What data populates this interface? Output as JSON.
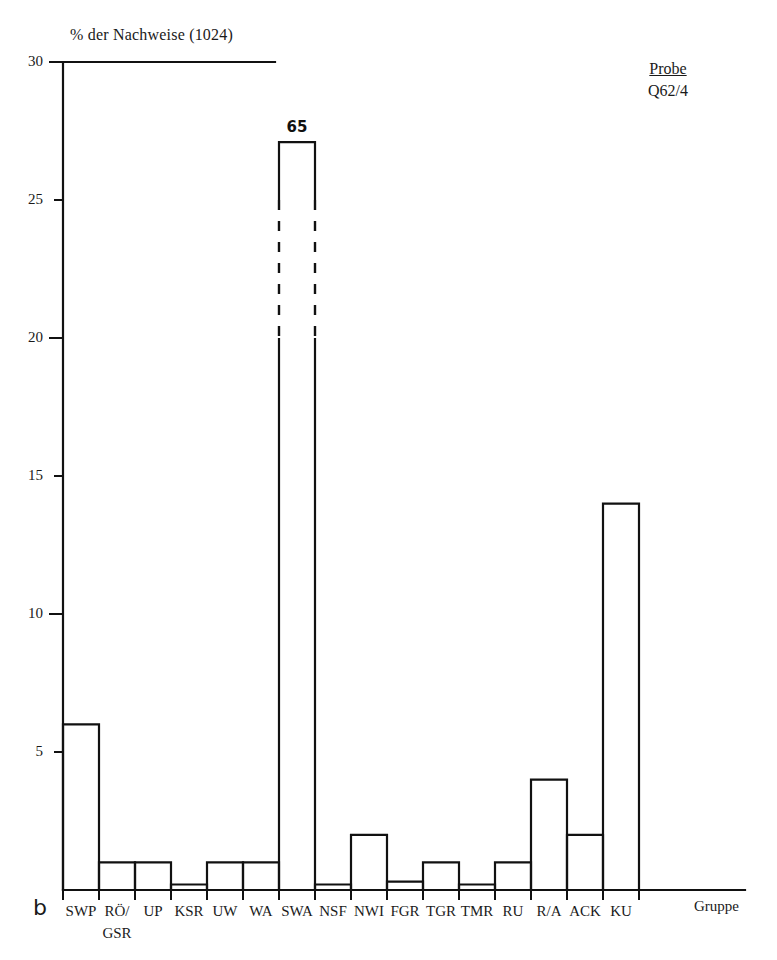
{
  "figure": {
    "panel_letter": "b",
    "title": "% der Nachweise (1024)",
    "sample_label": "Probe",
    "sample_value": "Q62/4",
    "x_axis_caption": "Gruppe"
  },
  "chart_data": {
    "type": "bar",
    "title": "% der Nachweise (1024)",
    "subtitle": "Probe Q62/4",
    "xlabel": "Gruppe",
    "ylabel": "% der Nachweise (1024)",
    "ylim": [
      0,
      30
    ],
    "yticks": [
      5,
      10,
      15,
      20,
      25,
      30
    ],
    "ytick_labels": [
      "5",
      "10",
      "15",
      "20",
      "25",
      "30"
    ],
    "grid": false,
    "legend": "none",
    "total_count": 1024,
    "categories": [
      "SWP",
      "RÖ/​GSR",
      "UP",
      "KSR",
      "UW",
      "WA",
      "SWA",
      "NSF",
      "NWI",
      "FGR",
      "TGR",
      "TMR",
      "RU",
      "R/A",
      "ACK",
      "KU"
    ],
    "category_labels": [
      "SWP",
      "RÖ/",
      "UP",
      "KSR",
      "UW",
      "WA",
      "SWA",
      "NSF",
      "NWI",
      "FGR",
      "TGR",
      "TMR",
      "RU",
      "R/A",
      "ACK",
      "KU"
    ],
    "category_labels_line2": [
      "",
      "GSR",
      "",
      "",
      "",
      "",
      "",
      "",
      "",
      "",
      "",
      "",
      "",
      "",
      "",
      ""
    ],
    "values": [
      6,
      1,
      1,
      0.2,
      1,
      1,
      65,
      0.2,
      2,
      0.3,
      1,
      0.2,
      1,
      4,
      2,
      14
    ],
    "value_labels": [
      "",
      "",
      "",
      "",
      "",
      "",
      "65",
      "",
      "",
      "",
      "",
      "",
      "",
      "",
      "",
      ""
    ],
    "broken_axis_bars": [
      "SWA"
    ],
    "broken_bar_drawn_top": 27.1,
    "broken_bar_break_from": 20,
    "broken_bar_break_to": 25,
    "bar_style": "outline",
    "bar_fill": "#ffffff",
    "bar_stroke": "#111111"
  }
}
